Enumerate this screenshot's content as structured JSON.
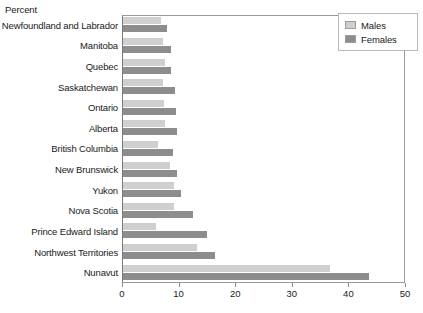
{
  "chart_data": {
    "type": "bar",
    "orientation": "horizontal",
    "title": "",
    "subtitle": "",
    "xlabel": "",
    "ylabel": "Percent",
    "axis_caption": "Percent",
    "xlim": [
      0,
      50
    ],
    "xticks": [
      0,
      10,
      20,
      30,
      40,
      50
    ],
    "xtick_labels": [
      "0",
      "10",
      "20",
      "30",
      "40",
      "50"
    ],
    "grid": false,
    "legend_position": "top-right",
    "categories": [
      "Newfoundland and Labrador",
      "Manitoba",
      "Quebec",
      "Saskatchewan",
      "Ontario",
      "Alberta",
      "British Columbia",
      "New Brunswick",
      "Yukon",
      "Nova Scotia",
      "Prince Edward Island",
      "Northwest Territories",
      "Nunavut"
    ],
    "series": [
      {
        "name": "Males",
        "color": "#cfcfcf",
        "values": [
          6.8,
          7.0,
          7.4,
          7.1,
          7.2,
          7.4,
          6.1,
          8.3,
          9.0,
          9.0,
          5.8,
          13.0,
          36.6
        ]
      },
      {
        "name": "Females",
        "color": "#8d8d8d",
        "values": [
          7.7,
          8.4,
          8.4,
          9.1,
          9.3,
          9.6,
          8.9,
          9.6,
          10.3,
          12.4,
          14.9,
          16.2,
          43.4
        ]
      }
    ]
  },
  "legend": {
    "items": [
      {
        "label": "Males",
        "key": "males"
      },
      {
        "label": "Females",
        "key": "females"
      }
    ]
  }
}
